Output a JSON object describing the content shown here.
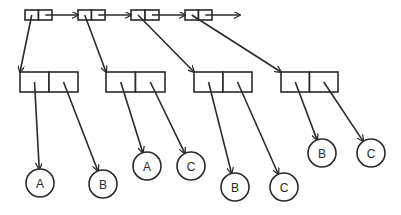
{
  "diagram": {
    "type": "linked-list-of-pairs",
    "colors": {
      "stroke": "#2a2a2a",
      "background": "#ffffff"
    },
    "spine": [
      {
        "id": "s1",
        "x": 25,
        "y": 10,
        "w": 27,
        "h": 10
      },
      {
        "id": "s2",
        "x": 78,
        "y": 10,
        "w": 27,
        "h": 10
      },
      {
        "id": "s3",
        "x": 131,
        "y": 10,
        "w": 28,
        "h": 10
      },
      {
        "id": "s4",
        "x": 185,
        "y": 10,
        "w": 27,
        "h": 10
      }
    ],
    "spine_tail_arrow_end": 240,
    "pairs": [
      {
        "id": "p1",
        "x": 20,
        "y": 72,
        "w": 58,
        "h": 20
      },
      {
        "id": "p2",
        "x": 106,
        "y": 72,
        "w": 59,
        "h": 20
      },
      {
        "id": "p3",
        "x": 194,
        "y": 72,
        "w": 58,
        "h": 20
      },
      {
        "id": "p4",
        "x": 281,
        "y": 72,
        "w": 57,
        "h": 20
      }
    ],
    "nodes": [
      {
        "id": "n1",
        "label": "A",
        "cx": 40,
        "cy": 183,
        "r": 14
      },
      {
        "id": "n2",
        "label": "B",
        "cx": 103,
        "cy": 184,
        "r": 14
      },
      {
        "id": "n3",
        "label": "A",
        "cx": 147,
        "cy": 166,
        "r": 14
      },
      {
        "id": "n4",
        "label": "C",
        "cx": 191,
        "cy": 166,
        "r": 14
      },
      {
        "id": "n5",
        "label": "B",
        "cx": 235,
        "cy": 187,
        "r": 14
      },
      {
        "id": "n6",
        "label": "C",
        "cx": 284,
        "cy": 187,
        "r": 14
      },
      {
        "id": "n7",
        "label": "B",
        "cx": 322,
        "cy": 153,
        "r": 14
      },
      {
        "id": "n8",
        "label": "C",
        "cx": 371,
        "cy": 153,
        "r": 14
      }
    ]
  }
}
